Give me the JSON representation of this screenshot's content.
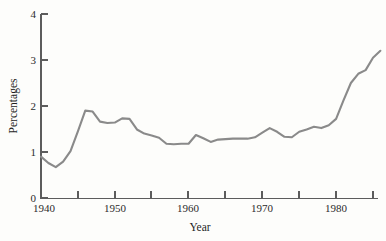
{
  "figure": {
    "background_color": "#fdfdfb",
    "width": 386,
    "height": 241
  },
  "chart_data": {
    "type": "line",
    "title": "",
    "subtitle": "",
    "xlabel": "Year",
    "ylabel": "Percentages",
    "xlim": [
      1940,
      1986
    ],
    "ylim": [
      0,
      4
    ],
    "grid": false,
    "legend": null,
    "legend_position": "none",
    "line_color": "#8a8a8a",
    "axis_color": "#5c5c5c",
    "x_ticks": [
      1940,
      1945,
      1950,
      1955,
      1960,
      1965,
      1970,
      1975,
      1980,
      1985
    ],
    "x_tick_labels": [
      "1940",
      "",
      "1950",
      "",
      "1960",
      "",
      "1970",
      "",
      "1980",
      ""
    ],
    "x_major_labels": [
      "1940",
      "1950",
      "1960",
      "1970",
      "1980"
    ],
    "y_ticks": [
      0,
      1,
      2,
      3,
      4
    ],
    "y_tick_labels": [
      "0",
      "1",
      "2",
      "3",
      "4"
    ],
    "series": [
      {
        "name": "Percentages",
        "color": "#8a8a8a",
        "x": [
          1940,
          1941,
          1942,
          1943,
          1944,
          1945,
          1946,
          1947,
          1948,
          1949,
          1950,
          1951,
          1952,
          1953,
          1954,
          1955,
          1956,
          1957,
          1958,
          1959,
          1960,
          1961,
          1962,
          1963,
          1964,
          1965,
          1966,
          1967,
          1968,
          1969,
          1970,
          1971,
          1972,
          1973,
          1974,
          1975,
          1976,
          1977,
          1978,
          1979,
          1980,
          1981,
          1982,
          1983,
          1984,
          1985,
          1986
        ],
        "values": [
          0.9,
          0.76,
          0.67,
          0.79,
          1.02,
          1.45,
          1.9,
          1.88,
          1.66,
          1.63,
          1.64,
          1.73,
          1.72,
          1.49,
          1.4,
          1.36,
          1.31,
          1.18,
          1.17,
          1.18,
          1.18,
          1.37,
          1.3,
          1.22,
          1.27,
          1.28,
          1.29,
          1.29,
          1.29,
          1.32,
          1.42,
          1.52,
          1.44,
          1.33,
          1.32,
          1.44,
          1.49,
          1.55,
          1.52,
          1.58,
          1.72,
          2.12,
          2.5,
          2.7,
          2.78,
          3.05,
          3.2
        ]
      }
    ],
    "annotations": []
  },
  "labels": {
    "y_axis_title": "Percentages",
    "x_axis_title": "Year",
    "y_tick_0": "0",
    "y_tick_1": "1",
    "y_tick_2": "2",
    "y_tick_3": "3",
    "y_tick_4": "4",
    "x_tick_1940": "1940",
    "x_tick_1950": "1950",
    "x_tick_1960": "1960",
    "x_tick_1970": "1970",
    "x_tick_1980": "1980"
  }
}
